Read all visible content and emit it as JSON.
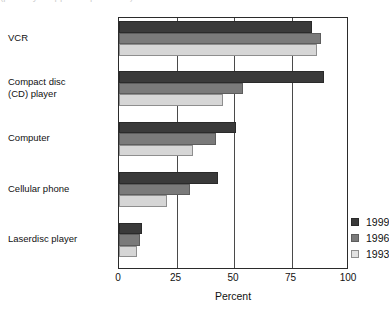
{
  "top_clipped_text": "(partially cropped caption line)",
  "chart_data": {
    "type": "bar",
    "orientation": "horizontal",
    "title": "",
    "xlabel": "Percent",
    "ylabel": "",
    "xlim": [
      0,
      100
    ],
    "xticks": [
      0,
      25,
      50,
      75,
      100
    ],
    "xtick_labels": [
      "0",
      "25",
      "50",
      "75",
      "100"
    ],
    "grid": true,
    "legend_position": "inside-lower-right",
    "categories": [
      "VCR",
      "Compact disc\n(CD) player",
      "Computer",
      "Cellular phone",
      "Laserdisc player"
    ],
    "series": [
      {
        "name": "1999",
        "color": "#3a3a3a",
        "values": [
          84,
          89,
          51,
          43,
          10
        ]
      },
      {
        "name": "1996",
        "color": "#7a7a7a",
        "values": [
          88,
          54,
          42,
          31,
          9
        ]
      },
      {
        "name": "1993",
        "color": "#d6d6d6",
        "values": [
          86,
          45,
          32,
          21,
          8
        ]
      }
    ]
  },
  "category_lines": [
    [
      "VCR"
    ],
    [
      "Compact disc",
      "(CD) player"
    ],
    [
      "Computer"
    ],
    [
      "Cellular phone"
    ],
    [
      "Laserdisc player"
    ]
  ]
}
